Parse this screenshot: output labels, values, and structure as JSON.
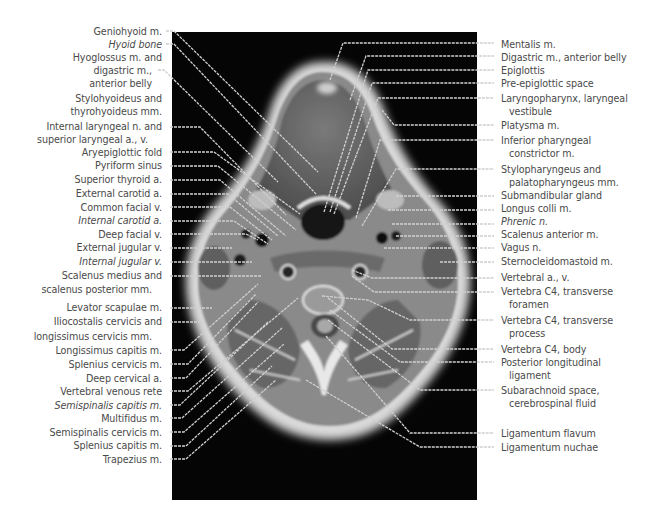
{
  "figure": {
    "colors": {
      "background": "#ffffff",
      "panel": "#050505",
      "label_text": "#4a4a4a",
      "leader_line": "#d8d8d8"
    }
  },
  "labels_left": [
    {
      "id": "L1",
      "lines": [
        "Geniohyoid m."
      ],
      "y": 31,
      "italic": false,
      "tx": 183,
      "ty": 32,
      "px": 318,
      "py": 175
    },
    {
      "id": "L2",
      "lines": [
        "Hyoid bone"
      ],
      "y": 44,
      "italic": true,
      "tx": 183,
      "ty": 45,
      "px": 318,
      "py": 195
    },
    {
      "id": "L3",
      "lines": [
        "Hyoglossus m. and",
        "digastric m.,",
        "anterior belly"
      ],
      "y": 57,
      "italic": false,
      "tx": 165,
      "ty": 69,
      "px": 283,
      "py": 182
    },
    {
      "id": "L4",
      "lines": [
        "Stylohyoideus and",
        "thyrohyoideus mm."
      ],
      "y": 98,
      "italic": false,
      "tx": 0,
      "ty": 0,
      "px": 0,
      "py": 0
    },
    {
      "id": "L5",
      "lines": [
        "Internal laryngeal n. and",
        "superior laryngeal a., v."
      ],
      "y": 126,
      "italic": false,
      "tx": 174,
      "ty": 127,
      "px": 282,
      "py": 218
    },
    {
      "id": "L6",
      "lines": [
        "Aryepiglottic fold"
      ],
      "y": 152,
      "italic": false,
      "tx": 174,
      "ty": 150,
      "px": 300,
      "py": 215
    },
    {
      "id": "L7",
      "lines": [
        "Pyriform sinus"
      ],
      "y": 165,
      "italic": false,
      "tx": 174,
      "ty": 165,
      "px": 292,
      "py": 230
    },
    {
      "id": "L8",
      "lines": [
        "Superior thyroid a."
      ],
      "y": 179,
      "italic": false,
      "tx": 174,
      "ty": 180,
      "px": 284,
      "py": 236
    },
    {
      "id": "L9",
      "lines": [
        "External carotid a."
      ],
      "y": 193,
      "italic": false,
      "tx": 174,
      "ty": 195,
      "px": 278,
      "py": 236
    },
    {
      "id": "L10",
      "lines": [
        "Common facial v."
      ],
      "y": 207,
      "italic": false,
      "tx": 174,
      "ty": 208,
      "px": 270,
      "py": 240
    },
    {
      "id": "L11",
      "lines": [
        "Internal carotid a."
      ],
      "y": 220,
      "italic": true,
      "tx": 174,
      "ty": 222,
      "px": 270,
      "py": 242
    },
    {
      "id": "L12",
      "lines": [
        "Deep facial v."
      ],
      "y": 234,
      "italic": false,
      "tx": 174,
      "ty": 235,
      "px": 258,
      "py": 240
    },
    {
      "id": "L13",
      "lines": [
        "External jugular v."
      ],
      "y": 247,
      "italic": false,
      "tx": 174,
      "ty": 248,
      "px": 240,
      "py": 245
    },
    {
      "id": "L14",
      "lines": [
        "Internal jugular v."
      ],
      "y": 261,
      "italic": true,
      "tx": 174,
      "ty": 262,
      "px": 252,
      "py": 266
    },
    {
      "id": "L15",
      "lines": [
        "Scalenus medius and",
        "scalenus posterior mm."
      ],
      "y": 275,
      "italic": false,
      "tx": 174,
      "ty": 275,
      "px": 260,
      "py": 275
    },
    {
      "id": "L16",
      "lines": [
        "Levator scapulae m."
      ],
      "y": 307,
      "italic": false,
      "tx": 174,
      "ty": 308,
      "px": 212,
      "py": 308
    },
    {
      "id": "L17",
      "lines": [
        "Iliocostalis cervicis and",
        "longissimus cervicis mm."
      ],
      "y": 321,
      "italic": false,
      "tx": 174,
      "ty": 321,
      "px": 204,
      "py": 321
    },
    {
      "id": "L18",
      "lines": [
        "Longissimus capitis m."
      ],
      "y": 350,
      "italic": false,
      "tx": 174,
      "ty": 350,
      "px": 258,
      "py": 284
    },
    {
      "id": "L19",
      "lines": [
        "Splenius cervicis m."
      ],
      "y": 364,
      "italic": false,
      "tx": 174,
      "ty": 364,
      "px": 256,
      "py": 294
    },
    {
      "id": "L20",
      "lines": [
        "Deep cervical a."
      ],
      "y": 378,
      "italic": false,
      "tx": 174,
      "ty": 378,
      "px": 256,
      "py": 300
    },
    {
      "id": "L21",
      "lines": [
        "Vertebral venous rete"
      ],
      "y": 391,
      "italic": false,
      "tx": 174,
      "ty": 391,
      "px": 296,
      "py": 298
    },
    {
      "id": "L22",
      "lines": [
        "Semispinalis capitis m."
      ],
      "y": 405,
      "italic": true,
      "tx": 174,
      "ty": 405,
      "px": 266,
      "py": 320
    },
    {
      "id": "L23",
      "lines": [
        "Multifidus m."
      ],
      "y": 418,
      "italic": false,
      "tx": 174,
      "ty": 418,
      "px": 282,
      "py": 326
    },
    {
      "id": "L24",
      "lines": [
        "Semispinalis cervicis m."
      ],
      "y": 432,
      "italic": false,
      "tx": 174,
      "ty": 432,
      "px": 284,
      "py": 343
    },
    {
      "id": "L25",
      "lines": [
        "Splenius capitis m."
      ],
      "y": 445,
      "italic": false,
      "tx": 174,
      "ty": 445,
      "px": 272,
      "py": 365
    },
    {
      "id": "L26",
      "lines": [
        "Trapezius m."
      ],
      "y": 459,
      "italic": false,
      "tx": 174,
      "ty": 459,
      "px": 276,
      "py": 379
    }
  ],
  "labels_right": [
    {
      "id": "R1",
      "lines": [
        "Mentalis m."
      ],
      "y": 44,
      "italic": false
    },
    {
      "id": "R2",
      "lines": [
        "Digastric m., anterior belly"
      ],
      "y": 57,
      "italic": false
    },
    {
      "id": "R3",
      "lines": [
        "Epiglottis"
      ],
      "y": 70,
      "italic": false
    },
    {
      "id": "R4",
      "lines": [
        "Pre-epiglottic space"
      ],
      "y": 83,
      "italic": false
    },
    {
      "id": "R5",
      "lines": [
        "Laryngopharynx, laryngeal",
        "vestibule"
      ],
      "y": 98,
      "italic": false
    },
    {
      "id": "R6",
      "lines": [
        "Platysma m."
      ],
      "y": 125,
      "italic": false
    },
    {
      "id": "R7",
      "lines": [
        "Inferior pharyngeal",
        "constrictor m."
      ],
      "y": 140,
      "italic": false
    },
    {
      "id": "R8",
      "lines": [
        "Stylopharyngeus and",
        "palatopharyngeus mm."
      ],
      "y": 169,
      "italic": false
    },
    {
      "id": "R9",
      "lines": [
        "Submandibular gland"
      ],
      "y": 195,
      "italic": false
    },
    {
      "id": "R10",
      "lines": [
        "Longus colli m."
      ],
      "y": 208,
      "italic": false
    },
    {
      "id": "R11",
      "lines": [
        "Phrenic n."
      ],
      "y": 221,
      "italic": true
    },
    {
      "id": "R12",
      "lines": [
        "Scalenus anterior m."
      ],
      "y": 234,
      "italic": false
    },
    {
      "id": "R13",
      "lines": [
        "Vagus n."
      ],
      "y": 247,
      "italic": false
    },
    {
      "id": "R14",
      "lines": [
        "Sternocleidomastoid m."
      ],
      "y": 261,
      "italic": false
    },
    {
      "id": "R15",
      "lines": [
        "Vertebral a., v."
      ],
      "y": 277,
      "italic": false
    },
    {
      "id": "R16",
      "lines": [
        "Vertebra C4, transverse",
        "foramen"
      ],
      "y": 291,
      "italic": false
    },
    {
      "id": "R17",
      "lines": [
        "Vertebra C4, transverse",
        "process"
      ],
      "y": 320,
      "italic": false
    },
    {
      "id": "R18",
      "lines": [
        "Vertebra C4, body"
      ],
      "y": 349,
      "italic": false
    },
    {
      "id": "R19",
      "lines": [
        "Posterior longitudinal",
        "ligament"
      ],
      "y": 362,
      "italic": false
    },
    {
      "id": "R20",
      "lines": [
        "Subarachnoid space,",
        "cerebrospinal fluid"
      ],
      "y": 390,
      "italic": false
    },
    {
      "id": "R21",
      "lines": [
        "Ligamentum flavum"
      ],
      "y": 433,
      "italic": false
    },
    {
      "id": "R22",
      "lines": [
        "Ligamentum nuchae"
      ],
      "y": 447,
      "italic": false
    }
  ]
}
